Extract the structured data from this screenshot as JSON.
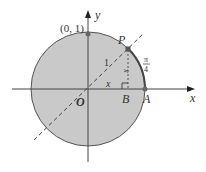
{
  "diagram": {
    "type": "unit-circle",
    "colors": {
      "fill": "#c9c9c9",
      "stroke": "#555555",
      "axis": "#444444",
      "point": "#666666",
      "text": "#333333"
    },
    "labels": {
      "y_axis": "y",
      "x_axis": "x",
      "origin": "O",
      "top_point": "(0, 1)",
      "point_p": "P",
      "point_a": "A",
      "point_b": "B",
      "radius": "1",
      "vertical_leg": "x",
      "horizontal_leg": "x",
      "angle_num": "π",
      "angle_den": "4"
    }
  }
}
